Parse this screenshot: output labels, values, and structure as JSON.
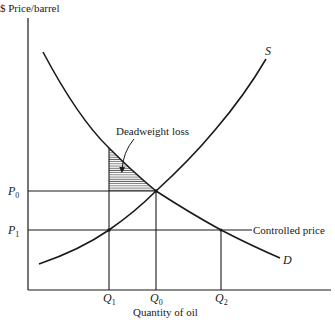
{
  "axes": {
    "y_label": "$ Price/barrel",
    "x_label": "Quantity of oil"
  },
  "curves": {
    "supply_label": "S",
    "demand_label": "D"
  },
  "price_labels": {
    "p0": {
      "base": "P",
      "sub": "0"
    },
    "p1": {
      "base": "P",
      "sub": "1"
    }
  },
  "quantity_labels": {
    "q1": {
      "base": "Q",
      "sub": "1"
    },
    "q0": {
      "base": "Q",
      "sub": "0"
    },
    "q2": {
      "base": "Q",
      "sub": "2"
    }
  },
  "annotations": {
    "deadweight_loss": "Deadweight loss",
    "controlled_price": "Controlled price"
  },
  "colors": {
    "line": "#1a1a1a",
    "hatch": "#555555",
    "background": "#ffffff"
  }
}
